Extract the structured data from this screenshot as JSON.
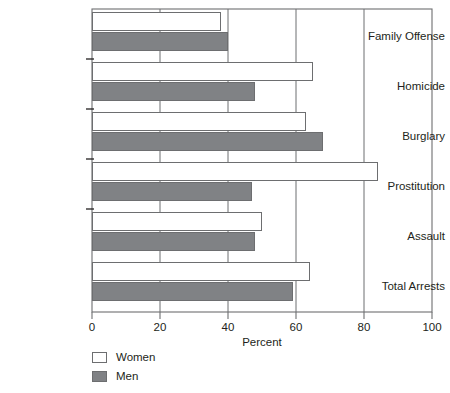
{
  "chart_data": {
    "type": "bar",
    "orientation": "horizontal",
    "title": "",
    "xlabel": "Percent",
    "ylabel": "",
    "xlim": [
      0,
      100
    ],
    "xticks": [
      0,
      20,
      40,
      60,
      80,
      100
    ],
    "xtick_labels": [
      "0",
      "20",
      "40",
      "60",
      "80",
      "100"
    ],
    "grid": true,
    "legend_position": "bottom-left",
    "categories": [
      "Family Offense",
      "Homicide",
      "Burglary",
      "Prostitution",
      "Assault",
      "Total Arrests"
    ],
    "series": [
      {
        "name": "Women",
        "color": "#ffffff",
        "values": [
          38,
          65,
          63,
          84,
          50,
          64
        ]
      },
      {
        "name": "Men",
        "color": "#808285",
        "values": [
          40,
          48,
          68,
          47,
          48,
          59
        ]
      }
    ]
  },
  "axis": {
    "x_title": "Percent",
    "tick_labels": [
      "0",
      "20",
      "40",
      "60",
      "80",
      "100"
    ]
  },
  "categories": [
    {
      "label": "Family Offense"
    },
    {
      "label": "Homicide"
    },
    {
      "label": "Burglary"
    },
    {
      "label": "Prostitution"
    },
    {
      "label": "Assault"
    },
    {
      "label": "Total Arrests"
    }
  ],
  "legend": {
    "items": [
      {
        "label": "Women",
        "swatch": "white"
      },
      {
        "label": "Men",
        "swatch": "gray"
      }
    ]
  }
}
